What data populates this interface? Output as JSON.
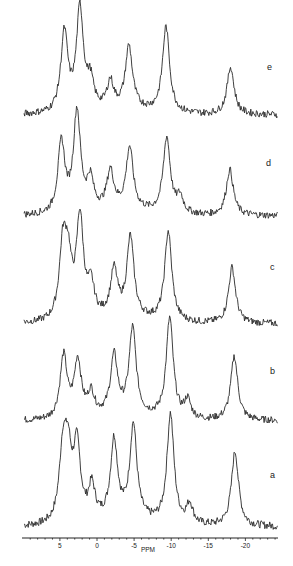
{
  "figure": {
    "axis_label": "PPM",
    "trace_color": "#2a2a2a",
    "background": "#ffffff"
  },
  "chart_data": {
    "type": "line",
    "title": "",
    "xlabel": "PPM",
    "ylabel": "",
    "xlim": [
      10,
      -24.5
    ],
    "x_reversed": true,
    "x_ticks": [
      5,
      0,
      -5,
      -10,
      -15,
      -20
    ],
    "x_tick_labels": [
      "5",
      "0",
      "-5",
      "-10",
      "-15",
      "-20"
    ],
    "grid": false,
    "legend": "none; each trace labeled at right",
    "stacked": true,
    "series": [
      {
        "name": "a",
        "peaks": [
          {
            "ppm": 4.6,
            "height": 0.62
          },
          {
            "ppm": 3.9,
            "height": 0.55
          },
          {
            "ppm": 2.7,
            "height": 0.66
          },
          {
            "ppm": 0.7,
            "height": 0.3
          },
          {
            "ppm": -2.3,
            "height": 0.72
          },
          {
            "ppm": -4.9,
            "height": 0.86
          },
          {
            "ppm": -9.9,
            "height": 1.0
          },
          {
            "ppm": -12.5,
            "height": 0.18
          },
          {
            "ppm": -18.6,
            "height": 0.68
          }
        ]
      },
      {
        "name": "b",
        "peaks": [
          {
            "ppm": 4.5,
            "height": 0.62
          },
          {
            "ppm": 2.6,
            "height": 0.56
          },
          {
            "ppm": 0.8,
            "height": 0.22
          },
          {
            "ppm": -2.3,
            "height": 0.58
          },
          {
            "ppm": -4.8,
            "height": 0.86
          },
          {
            "ppm": -9.8,
            "height": 1.0
          },
          {
            "ppm": -12.2,
            "height": 0.18
          },
          {
            "ppm": -18.5,
            "height": 0.64
          }
        ]
      },
      {
        "name": "c",
        "peaks": [
          {
            "ppm": 4.6,
            "height": 0.7
          },
          {
            "ppm": 3.9,
            "height": 0.52
          },
          {
            "ppm": 2.3,
            "height": 1.0
          },
          {
            "ppm": 0.8,
            "height": 0.3
          },
          {
            "ppm": -2.3,
            "height": 0.46
          },
          {
            "ppm": -4.5,
            "height": 0.8
          },
          {
            "ppm": -9.6,
            "height": 0.9
          },
          {
            "ppm": -18.2,
            "height": 0.56
          }
        ]
      },
      {
        "name": "d",
        "peaks": [
          {
            "ppm": 4.8,
            "height": 0.7
          },
          {
            "ppm": 2.7,
            "height": 1.0
          },
          {
            "ppm": 0.9,
            "height": 0.3
          },
          {
            "ppm": -1.8,
            "height": 0.38
          },
          {
            "ppm": -4.4,
            "height": 0.62
          },
          {
            "ppm": -9.4,
            "height": 0.76
          },
          {
            "ppm": -11.2,
            "height": 0.16
          },
          {
            "ppm": -17.9,
            "height": 0.46
          }
        ]
      },
      {
        "name": "e",
        "peaks": [
          {
            "ppm": 4.4,
            "height": 0.78
          },
          {
            "ppm": 2.3,
            "height": 1.0
          },
          {
            "ppm": 0.9,
            "height": 0.26
          },
          {
            "ppm": -1.8,
            "height": 0.26
          },
          {
            "ppm": -4.3,
            "height": 0.62
          },
          {
            "ppm": -9.3,
            "height": 0.85
          },
          {
            "ppm": -18.0,
            "height": 0.47
          }
        ]
      }
    ]
  },
  "layout": {
    "plot_left_px": 22,
    "plot_right_px": 278,
    "px_per_ppm": 7.42,
    "zero_ppm_px": 97,
    "axis_y_px": 538,
    "traces": [
      {
        "label": "a",
        "baseline_px": 527,
        "scale_px": 110,
        "label_x": 270,
        "label_y": 478
      },
      {
        "label": "b",
        "baseline_px": 421,
        "scale_px": 100,
        "label_x": 270,
        "label_y": 374
      },
      {
        "label": "c",
        "baseline_px": 324,
        "scale_px": 100,
        "label_x": 270,
        "label_y": 270
      },
      {
        "label": "d",
        "baseline_px": 216,
        "scale_px": 100,
        "label_x": 266,
        "label_y": 166
      },
      {
        "label": "e",
        "baseline_px": 115,
        "scale_px": 101,
        "label_x": 267,
        "label_y": 70
      }
    ]
  }
}
